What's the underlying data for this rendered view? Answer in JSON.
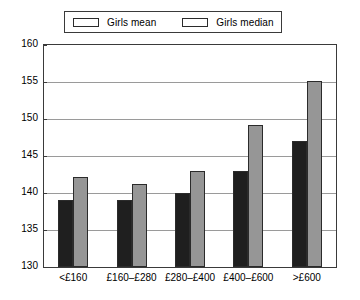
{
  "chart_data": {
    "type": "bar",
    "title": "",
    "xlabel": "",
    "ylabel": "",
    "categories": [
      "<£160",
      "£160–£280",
      "£280–£400",
      "£400–£600",
      ">£600"
    ],
    "series": [
      {
        "name": "Girls mean",
        "color": "#1f1f1f",
        "values": [
          139,
          139,
          140,
          143,
          147
        ]
      },
      {
        "name": "Girls median",
        "color": "#969696",
        "values": [
          142.2,
          141.2,
          143,
          149.2,
          155.2
        ]
      }
    ],
    "ylim": [
      130,
      160
    ],
    "yticks": [
      130,
      135,
      140,
      145,
      150,
      155,
      160
    ],
    "ytick_labels": [
      "130",
      "135",
      "140",
      "145",
      "150",
      "155",
      "160"
    ],
    "grid": true,
    "legend_position": "top-center"
  },
  "legend": {
    "entries": [
      {
        "label": "Girls mean"
      },
      {
        "label": "Girls median"
      }
    ]
  }
}
